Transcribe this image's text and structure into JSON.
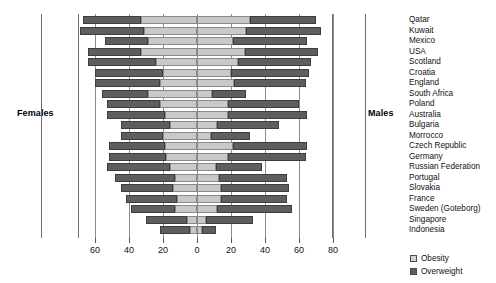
{
  "labels": {
    "females": "Females",
    "males": "Males"
  },
  "legend": [
    {
      "key": "obesity",
      "label": "Obesity",
      "color": "#d2d2d2"
    },
    {
      "key": "overweight",
      "label": "Overweight",
      "color": "#5e5e5e"
    }
  ],
  "chart_data": {
    "type": "bar",
    "subtype": "diverging-stacked-population-pyramid",
    "title": "",
    "xlabel": "",
    "ylabel": "",
    "left_side": "Females",
    "right_side": "Males",
    "grid": true,
    "legend_position": "bottom-right",
    "xlim": [
      -70,
      80
    ],
    "tick_values": [
      -60,
      -40,
      -20,
      0,
      20,
      40,
      60,
      80
    ],
    "tick_labels": [
      "60",
      "40",
      "20",
      "0",
      "20",
      "40",
      "60",
      "80"
    ],
    "series": [
      {
        "name": "Obesity",
        "color": "#d2d2d2"
      },
      {
        "name": "Overweight",
        "color": "#5e5e5e"
      }
    ],
    "categories": [
      "Qatar",
      "Kuwait",
      "Mexico",
      "USA",
      "Scotland",
      "Croatia",
      "England",
      "South Africa",
      "Poland",
      "Australia",
      "Bulgaria",
      "Morrocco",
      "Czech Republic",
      "Germany",
      "Russian Federation",
      "Portugal",
      "Slovakia",
      "France",
      "Sweden (Goteborg)",
      "Singapore",
      "Indonesia"
    ],
    "rows": [
      {
        "country": "Qatar",
        "female_obesity": 33,
        "female_overweight": 34,
        "male_obesity": 31,
        "male_overweight": 39
      },
      {
        "country": "Kuwait",
        "female_obesity": 31,
        "female_overweight": 38,
        "male_obesity": 29,
        "male_overweight": 44
      },
      {
        "country": "Mexico",
        "female_obesity": 29,
        "female_overweight": 25,
        "male_obesity": 21,
        "male_overweight": 44
      },
      {
        "country": "USA",
        "female_obesity": 33,
        "female_overweight": 31,
        "male_obesity": 28,
        "male_overweight": 43
      },
      {
        "country": "Scotland",
        "female_obesity": 24,
        "female_overweight": 40,
        "male_obesity": 24,
        "male_overweight": 43
      },
      {
        "country": "Croatia",
        "female_obesity": 20,
        "female_overweight": 40,
        "male_obesity": 20,
        "male_overweight": 46
      },
      {
        "country": "England",
        "female_obesity": 22,
        "female_overweight": 38,
        "male_obesity": 22,
        "male_overweight": 42
      },
      {
        "country": "South Africa",
        "female_obesity": 29,
        "female_overweight": 27,
        "male_obesity": 9,
        "male_overweight": 20
      },
      {
        "country": "Poland",
        "female_obesity": 22,
        "female_overweight": 31,
        "male_obesity": 18,
        "male_overweight": 42
      },
      {
        "country": "Australia",
        "female_obesity": 19,
        "female_overweight": 34,
        "male_obesity": 18,
        "male_overweight": 47
      },
      {
        "country": "Bulgaria",
        "female_obesity": 16,
        "female_overweight": 29,
        "male_obesity": 12,
        "male_overweight": 36
      },
      {
        "country": "Morrocco",
        "female_obesity": 20,
        "female_overweight": 25,
        "male_obesity": 8,
        "male_overweight": 23
      },
      {
        "country": "Czech Republic",
        "female_obesity": 19,
        "female_overweight": 33,
        "male_obesity": 21,
        "male_overweight": 44
      },
      {
        "country": "Germany",
        "female_obesity": 18,
        "female_overweight": 34,
        "male_obesity": 18,
        "male_overweight": 46
      },
      {
        "country": "Russian Federation",
        "female_obesity": 16,
        "female_overweight": 37,
        "male_obesity": 11,
        "male_overweight": 27
      },
      {
        "country": "Portugal",
        "female_obesity": 13,
        "female_overweight": 35,
        "male_obesity": 13,
        "male_overweight": 40
      },
      {
        "country": "Slovakia",
        "female_obesity": 14,
        "female_overweight": 31,
        "male_obesity": 14,
        "male_overweight": 40
      },
      {
        "country": "France",
        "female_obesity": 12,
        "female_overweight": 30,
        "male_obesity": 14,
        "male_overweight": 39
      },
      {
        "country": "Sweden (Goteborg)",
        "female_obesity": 13,
        "female_overweight": 26,
        "male_obesity": 12,
        "male_overweight": 44
      },
      {
        "country": "Singapore",
        "female_obesity": 6,
        "female_overweight": 24,
        "male_obesity": 5,
        "male_overweight": 28
      },
      {
        "country": "Indonesia",
        "female_obesity": 4,
        "female_overweight": 18,
        "male_obesity": 3,
        "male_overweight": 8
      }
    ]
  }
}
